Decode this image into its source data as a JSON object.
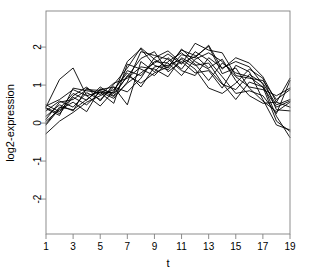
{
  "chart_data": {
    "type": "line",
    "title": "",
    "subtitle": "",
    "xlabel": "t",
    "ylabel": "log2-expression",
    "grid": false,
    "legend": false,
    "legend_position": "none",
    "line_color": "#000000",
    "background_color": "#ffffff",
    "box_color": "#808080",
    "xlim": [
      1,
      19
    ],
    "ylim": [
      -2.92,
      2.95
    ],
    "xticks": [
      1,
      3,
      5,
      7,
      9,
      11,
      13,
      15,
      17,
      19
    ],
    "xtick_labels": [
      "1",
      "3",
      "5",
      "7",
      "9",
      "11",
      "13",
      "15",
      "17",
      "19"
    ],
    "yticks": [
      -2,
      -1,
      0,
      1,
      2
    ],
    "ytick_labels": [
      "-2",
      "-1",
      "0",
      "1",
      "2"
    ],
    "x": [
      1,
      2,
      3,
      4,
      5,
      6,
      7,
      8,
      9,
      10,
      11,
      12,
      13,
      14,
      15,
      16,
      17,
      18,
      19
    ],
    "series": [
      {
        "name": "gene-1",
        "values": [
          0.42,
          1.15,
          1.45,
          0.72,
          0.82,
          0.8,
          1.62,
          1.95,
          1.52,
          1.4,
          1.8,
          1.72,
          2.05,
          1.42,
          1.72,
          1.58,
          1.22,
          0.55,
          1.18
        ]
      },
      {
        "name": "gene-2",
        "values": [
          0.1,
          0.55,
          0.62,
          0.88,
          0.86,
          0.7,
          1.05,
          1.32,
          1.58,
          1.82,
          1.55,
          2.1,
          1.92,
          1.85,
          1.25,
          1.18,
          1.12,
          0.62,
          0.88
        ]
      },
      {
        "name": "gene-3",
        "values": [
          0.48,
          0.3,
          0.72,
          0.95,
          0.58,
          1.02,
          1.45,
          1.98,
          1.68,
          1.45,
          1.95,
          1.62,
          1.42,
          1.02,
          0.88,
          1.28,
          1.05,
          0.48,
          0.62
        ]
      },
      {
        "name": "gene-4",
        "values": [
          -0.02,
          0.42,
          0.35,
          0.62,
          0.88,
          0.95,
          0.82,
          1.18,
          1.72,
          1.9,
          1.58,
          1.75,
          2.02,
          1.3,
          1.45,
          0.92,
          0.58,
          0.3,
          0.55
        ]
      },
      {
        "name": "gene-5",
        "values": [
          0.38,
          0.2,
          0.92,
          0.85,
          0.8,
          0.52,
          1.55,
          1.42,
          1.25,
          1.62,
          1.85,
          1.55,
          1.12,
          1.58,
          1.32,
          1.22,
          0.95,
          0.05,
          -0.22
        ]
      },
      {
        "name": "gene-6",
        "values": [
          -0.28,
          0.05,
          0.28,
          0.55,
          0.72,
          0.88,
          1.32,
          0.95,
          1.48,
          1.52,
          1.68,
          1.42,
          0.92,
          0.78,
          1.05,
          1.42,
          1.18,
          0.35,
          0.32
        ]
      },
      {
        "name": "gene-7",
        "values": [
          0.32,
          0.58,
          0.42,
          0.8,
          0.62,
          0.95,
          0.48,
          1.62,
          1.35,
          1.72,
          1.42,
          1.88,
          1.65,
          1.22,
          0.78,
          0.85,
          0.72,
          0.25,
          1.12
        ]
      },
      {
        "name": "gene-8",
        "values": [
          0.05,
          0.35,
          0.55,
          0.3,
          0.9,
          0.78,
          1.22,
          1.7,
          1.88,
          1.35,
          1.62,
          1.32,
          1.38,
          0.92,
          1.52,
          1.35,
          0.62,
          -0.05,
          -0.18
        ]
      },
      {
        "name": "gene-9",
        "values": [
          0.45,
          0.62,
          0.88,
          0.72,
          0.45,
          0.85,
          1.38,
          1.25,
          1.62,
          1.58,
          1.25,
          1.68,
          1.85,
          1.62,
          1.22,
          0.95,
          0.88,
          0.72,
          0.92
        ]
      },
      {
        "name": "gene-10",
        "values": [
          0.18,
          0.48,
          0.32,
          0.92,
          0.75,
          1.05,
          1.18,
          1.48,
          1.42,
          1.22,
          1.72,
          1.52,
          1.58,
          1.05,
          0.62,
          1.08,
          0.95,
          0.42,
          0.58
        ]
      },
      {
        "name": "gene-11",
        "values": [
          0.4,
          0.25,
          0.68,
          0.48,
          0.82,
          0.65,
          1.08,
          1.88,
          1.78,
          1.68,
          1.38,
          1.25,
          1.72,
          1.45,
          1.62,
          1.48,
          1.02,
          0.18,
          -0.38
        ]
      },
      {
        "name": "gene-12",
        "values": [
          -0.05,
          0.38,
          0.78,
          0.6,
          0.95,
          0.72,
          1.25,
          1.05,
          1.32,
          1.48,
          1.92,
          1.78,
          1.45,
          1.68,
          1.12,
          0.72,
          0.52,
          0.55,
          0.42
        ]
      }
    ]
  }
}
